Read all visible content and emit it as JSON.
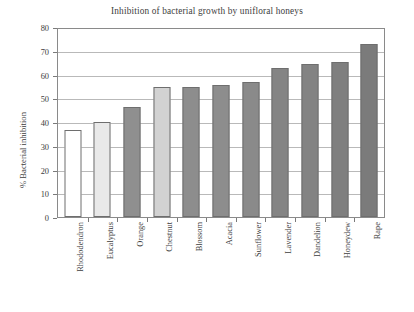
{
  "chart_data": {
    "type": "bar",
    "title": "Inhibition of  bacterial growth by unifloral honeys",
    "xlabel": "",
    "ylabel": "% Bacterial inhibition",
    "ylim": [
      0,
      80
    ],
    "ytick_step": 10,
    "ytick_labels": [
      "80",
      "70",
      "60",
      "50",
      "40",
      "30",
      "20",
      "10",
      "0"
    ],
    "grid": "horizontal",
    "legend": "none",
    "categories": [
      "Rhododendron",
      "Eucalyptus",
      "Orange",
      "Chestnut",
      "Blossom",
      "Acacia",
      "Sunflower",
      "Lavender",
      "Dandelion",
      "Honeydew",
      "Rape"
    ],
    "values": [
      37,
      40.5,
      47,
      55.5,
      55.5,
      56,
      57.5,
      63.5,
      65,
      66,
      73.5
    ],
    "bar_colors": [
      "#ffffff",
      "#e9e9e9",
      "#8f8f8f",
      "#d2d2d2",
      "#8d8d8d",
      "#8d8d8d",
      "#8a8a8a",
      "#848484",
      "#838383",
      "#7f7f7f",
      "#7b7b7b"
    ],
    "bar_border_color": "#6e6e6e",
    "axis_color": "#8a8a8a",
    "gridline_color": "#b9b9b9",
    "background": "#ffffff"
  }
}
